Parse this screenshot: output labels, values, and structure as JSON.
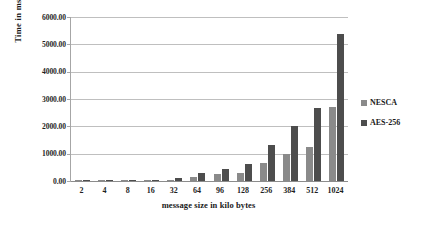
{
  "chart_data": {
    "type": "bar",
    "title": "",
    "xlabel": "message size in kilo bytes",
    "ylabel": "Time in ms",
    "categories": [
      "2",
      "4",
      "8",
      "16",
      "32",
      "64",
      "96",
      "128",
      "256",
      "384",
      "512",
      "1024"
    ],
    "series": [
      {
        "name": "NESCA",
        "color": "#8a8a8a",
        "values": [
          10,
          12,
          15,
          22,
          45,
          155,
          270,
          300,
          650,
          980,
          1250,
          2720
        ]
      },
      {
        "name": "AES-256",
        "color": "#4d4d4d",
        "values": [
          8,
          10,
          14,
          40,
          100,
          290,
          450,
          620,
          1310,
          2010,
          2680,
          5390
        ]
      }
    ],
    "ylim": [
      0,
      6000
    ],
    "ytick_values": [
      6000,
      5000,
      4000,
      3000,
      2000,
      1000,
      0
    ],
    "ytick_labels": [
      "6000.00",
      "5000.00",
      "4000.00",
      "3000.00",
      "2000.00",
      "1000.00",
      "0.00"
    ],
    "grid": true,
    "legend_position": "right"
  }
}
